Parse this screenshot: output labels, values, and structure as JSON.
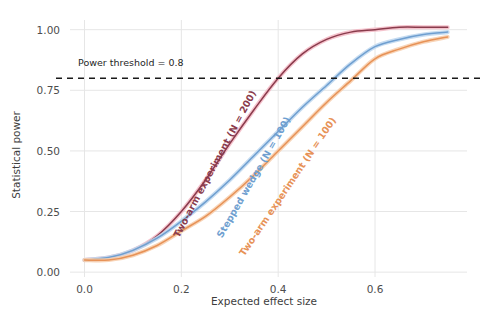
{
  "chart_data": {
    "type": "line",
    "title": "",
    "xlabel": "Expected effect size",
    "ylabel": "Statistical power",
    "xlim": [
      -0.03,
      0.79
    ],
    "ylim": [
      -0.02,
      1.04
    ],
    "xticks": [
      "0.0",
      "0.2",
      "0.4",
      "0.6"
    ],
    "xtick_values": [
      0.0,
      0.2,
      0.4,
      0.6
    ],
    "yticks": [
      "0.00",
      "0.25",
      "0.50",
      "0.75",
      "1.00"
    ],
    "ytick_values": [
      0.0,
      0.25,
      0.5,
      0.75,
      1.0
    ],
    "grid": true,
    "legend_position": "inline-curve-labels",
    "annotations": [
      {
        "name": "power-threshold",
        "text": "Power threshold = 0.8",
        "y_value": 0.8,
        "style": "dashed-horizontal-line",
        "color": "#1a1a1a"
      }
    ],
    "x": [
      0.0,
      0.05,
      0.1,
      0.15,
      0.2,
      0.25,
      0.3,
      0.35,
      0.4,
      0.45,
      0.5,
      0.55,
      0.6,
      0.65,
      0.7,
      0.75
    ],
    "series": [
      {
        "name": "Two-arm experiment (N = 200)",
        "color": "#8a3b4c",
        "halo_color": "#f3b9c4",
        "label_angle_deg": -62,
        "values": [
          0.05,
          0.06,
          0.09,
          0.15,
          0.25,
          0.38,
          0.53,
          0.67,
          0.8,
          0.9,
          0.96,
          0.99,
          1.0,
          1.01,
          1.01,
          1.01
        ]
      },
      {
        "name": "Stepped wedge (N = 100)",
        "color": "#6f9fd0",
        "halo_color": "#bcd6ee",
        "label_angle_deg": -60,
        "values": [
          0.05,
          0.06,
          0.09,
          0.14,
          0.21,
          0.29,
          0.38,
          0.48,
          0.58,
          0.68,
          0.77,
          0.86,
          0.93,
          0.96,
          0.98,
          0.99
        ]
      },
      {
        "name": "Two-arm experiment (N = 100)",
        "color": "#e79257",
        "halo_color": "#f7cdaa",
        "label_angle_deg": -56,
        "values": [
          0.05,
          0.05,
          0.07,
          0.11,
          0.17,
          0.23,
          0.31,
          0.4,
          0.5,
          0.6,
          0.7,
          0.79,
          0.88,
          0.92,
          0.95,
          0.97
        ]
      }
    ]
  },
  "figure": {
    "background_color": "#ffffff",
    "grid_color": "#e6e6e6",
    "text_color": "#4d4d4d"
  }
}
